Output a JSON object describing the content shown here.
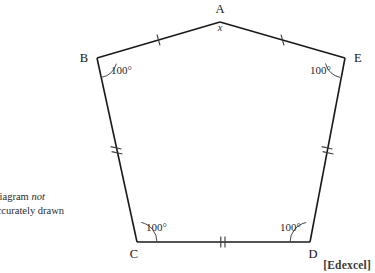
{
  "question": {
    "lines": [
      "n in",
      "D = DE.",
      "ed x°"
    ]
  },
  "note": {
    "line1_prefix": "Diagram ",
    "line1_italic": "not",
    "line2": "accurately drawn"
  },
  "credit": {
    "label": "[Edexcel]"
  },
  "figure": {
    "shape": "pentagon",
    "vertices": [
      {
        "name": "A",
        "label": "A",
        "x": 220,
        "y": 22
      },
      {
        "name": "B",
        "label": "B",
        "x": 97,
        "y": 58
      },
      {
        "name": "C",
        "label": "C",
        "x": 137,
        "y": 242
      },
      {
        "name": "D",
        "label": "D",
        "x": 310,
        "y": 242
      },
      {
        "name": "E",
        "label": "E",
        "x": 345,
        "y": 58
      }
    ],
    "vertex_labels": {
      "A": "A",
      "B": "B",
      "C": "C",
      "D": "D",
      "E": "E"
    },
    "angles": {
      "A": "x",
      "B": "100°",
      "C": "100°",
      "D": "100°",
      "E": "100°"
    },
    "edges": [
      {
        "name": "AB",
        "from": "A",
        "to": "B",
        "ticks": 1
      },
      {
        "name": "BC",
        "from": "B",
        "to": "C",
        "ticks": 2
      },
      {
        "name": "CD",
        "from": "C",
        "to": "D",
        "ticks": 2
      },
      {
        "name": "DE",
        "from": "D",
        "to": "E",
        "ticks": 2
      },
      {
        "name": "EA",
        "from": "E",
        "to": "A",
        "ticks": 1
      }
    ],
    "colors": {
      "stroke": "#1a1a1a",
      "tick": "#3f3f3f",
      "arc": "#4a4a4a",
      "text": "#141414",
      "background": "#ffffff"
    }
  }
}
